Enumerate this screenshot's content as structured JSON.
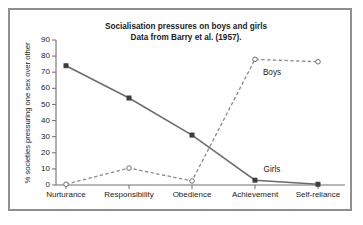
{
  "chart_data": {
    "type": "line",
    "title": "Socialisation pressures on boys and girls",
    "subtitle": "Data from Barry et al. (1957).",
    "xlabel": "",
    "ylabel": "% societies pressuring one sex over other",
    "categories": [
      "Nurturance",
      "Responsibility",
      "Obedience",
      "Achievement",
      "Self-reliance"
    ],
    "ylim": [
      0,
      90
    ],
    "ytick_step": 10,
    "yticks": [
      0,
      10,
      20,
      30,
      40,
      50,
      60,
      70,
      80,
      90
    ],
    "grid": false,
    "legend_position": "inline-annotation",
    "series": [
      {
        "name": "Girls",
        "values": [
          74,
          54,
          31,
          3,
          0.5
        ],
        "line_style": "solid",
        "marker": "filled-square",
        "color": "#6b6b6b",
        "label_x_category": "Achievement",
        "label_value": 8
      },
      {
        "name": "Boys",
        "values": [
          0.5,
          10.5,
          2.5,
          78,
          76.5
        ],
        "line_style": "dashed",
        "marker": "open-circle",
        "color": "#8a8a8a",
        "label_x_category": "Achievement",
        "label_value": 68
      }
    ],
    "annotations": [
      {
        "text": "Boys",
        "value": 68
      },
      {
        "text": "Girls",
        "value": 8
      }
    ]
  },
  "figure": {
    "frame_color": "#8f8f8f",
    "background_color": "#ffffff",
    "text_color": "#1b1b1b"
  },
  "axis": {
    "y_tick_0": "0",
    "y_tick_10": "10",
    "y_tick_20": "20",
    "y_tick_30": "30",
    "y_tick_40": "40",
    "y_tick_50": "50",
    "y_tick_60": "60",
    "y_tick_70": "70",
    "y_tick_80": "80",
    "y_tick_90": "90",
    "x_tick_0": "Nurturance",
    "x_tick_1": "Responsibility",
    "x_tick_2": "Obedience",
    "x_tick_3": "Achievement",
    "x_tick_4": "Self-reliance"
  },
  "labels": {
    "title_line1": "Socialisation pressures on boys and girls",
    "title_line2": "Data from Barry et al. (1957).",
    "y_axis_title": "% societies pressuring one sex over other",
    "series_boys": "Boys",
    "series_girls": "Girls"
  }
}
